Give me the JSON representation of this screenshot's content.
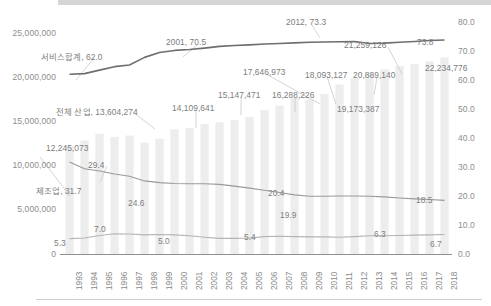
{
  "chart_data": {
    "type": "line",
    "title": "",
    "subtitle": "",
    "xlabel": "",
    "ylabel_left": "",
    "ylabel_right": "",
    "grid": false,
    "legend_position": "none",
    "categories": [
      "1993",
      "1994",
      "1995",
      "1996",
      "1997",
      "1998",
      "1999",
      "2000",
      "2001",
      "2002",
      "2003",
      "2004",
      "2005",
      "2006",
      "2007",
      "2008",
      "2009",
      "2010",
      "2011",
      "2012",
      "2013",
      "2014",
      "2015",
      "2016",
      "2017",
      "2018"
    ],
    "y_left_ticks": [
      "0",
      "5,000,000",
      "10,000,000",
      "15,000,000",
      "20,000,000",
      "25,000,000"
    ],
    "y_right_ticks": [
      "0.0",
      "10.0",
      "20.0",
      "30.0",
      "40.0",
      "50.0",
      "60.0",
      "70.0",
      "80.0"
    ],
    "ylim_left": [
      0,
      25000000
    ],
    "ylim_right": [
      0,
      80
    ],
    "series": [
      {
        "name": "전체 산업",
        "axis": "left",
        "type": "bar",
        "color": "#ededed",
        "values": [
          12245073,
          12846000,
          13604274,
          13250000,
          13400000,
          12600000,
          13050000,
          14109641,
          14250000,
          14700000,
          14900000,
          15147471,
          15500000,
          16288226,
          16800000,
          17646973,
          17500000,
          18093127,
          19173387,
          19900000,
          20400000,
          20889140,
          21259126,
          21500000,
          21800000,
          22234776
        ]
      },
      {
        "name": "서비스합계",
        "axis": "right",
        "type": "line",
        "color": "#6e6e6e",
        "values": [
          62.0,
          62.2,
          63.4,
          64.6,
          65.2,
          67.8,
          69.5,
          70.2,
          70.5,
          71.0,
          71.6,
          71.9,
          72.1,
          72.4,
          72.6,
          72.8,
          73.0,
          73.1,
          73.2,
          73.3,
          72.6,
          72.7,
          73.0,
          73.3,
          73.6,
          73.8
        ]
      },
      {
        "name": "제조업",
        "axis": "right",
        "type": "line",
        "color": "#9a9a9a",
        "values": [
          31.7,
          29.4,
          28.6,
          27.6,
          26.8,
          25.2,
          24.6,
          24.3,
          24.2,
          24.2,
          24.0,
          23.4,
          22.7,
          22.0,
          21.2,
          20.4,
          19.9,
          19.9,
          20.0,
          20.0,
          19.9,
          19.7,
          19.3,
          19.0,
          18.8,
          18.5
        ]
      },
      {
        "name": "건설업",
        "axis": "right",
        "type": "line",
        "color": "#b4b4b4",
        "values": [
          5.3,
          5.5,
          6.4,
          7.0,
          6.9,
          6.6,
          6.7,
          6.6,
          6.3,
          5.8,
          5.4,
          5.4,
          5.5,
          6.0,
          6.1,
          6.0,
          5.9,
          5.9,
          5.8,
          6.0,
          6.3,
          6.3,
          6.4,
          6.5,
          6.6,
          6.7
        ]
      }
    ],
    "annotations": [
      {
        "id": "a01",
        "text": "서비스합계, 62.0",
        "series": "서비스합계",
        "year": "1993",
        "value": 62.0
      },
      {
        "id": "a02",
        "text": "2001, 70.5",
        "series": "서비스합계",
        "year": "2001",
        "value": 70.5
      },
      {
        "id": "a03",
        "text": "2012, 73.3",
        "series": "서비스합계",
        "year": "2012",
        "value": 73.3
      },
      {
        "id": "a04",
        "text": "73.8",
        "series": "서비스합계",
        "year": "2018",
        "value": 73.8
      },
      {
        "id": "a05",
        "text": "제조업, 31.7",
        "series": "제조업",
        "year": "1993",
        "value": 31.7
      },
      {
        "id": "a06",
        "text": "29.4",
        "series": "제조업",
        "year": "1994",
        "value": 29.4
      },
      {
        "id": "a07",
        "text": "24.6",
        "series": "제조업",
        "year": "1999",
        "value": 24.6
      },
      {
        "id": "a08",
        "text": "20.4",
        "series": "제조업",
        "year": "2008",
        "value": 20.4
      },
      {
        "id": "a09",
        "text": "19.9",
        "series": "제조업",
        "year": "2009",
        "value": 19.9
      },
      {
        "id": "a10",
        "text": "18.5",
        "series": "제조업",
        "year": "2018",
        "value": 18.5
      },
      {
        "id": "a11",
        "text": "5.3",
        "series": "건설업",
        "year": "1993",
        "value": 5.3
      },
      {
        "id": "a12",
        "text": "7.0",
        "series": "건설업",
        "year": "1996",
        "value": 7.0
      },
      {
        "id": "a13",
        "text": "5.0",
        "series": "건설업",
        "year": "2001",
        "value": 5.0
      },
      {
        "id": "a14",
        "text": "5.4",
        "series": "건설업",
        "year": "2004",
        "value": 5.4
      },
      {
        "id": "a15",
        "text": "6.3",
        "series": "건설업",
        "year": "2014",
        "value": 6.3
      },
      {
        "id": "a16",
        "text": "6.7",
        "series": "건설업",
        "year": "2018",
        "value": 6.7
      },
      {
        "id": "a17",
        "text": "전체 산업, 13,604,274",
        "series": "전체 산업",
        "year": "1995",
        "value": 13604274
      },
      {
        "id": "a18",
        "text": "12,245,073",
        "series": "전체 산업",
        "year": "1993",
        "value": 12245073
      },
      {
        "id": "a19",
        "text": "14,109,641",
        "series": "전체 산업",
        "year": "2000",
        "value": 14109641
      },
      {
        "id": "a20",
        "text": "15,147,471",
        "series": "전체 산업",
        "year": "2004",
        "value": 15147471
      },
      {
        "id": "a21",
        "text": "16,288,226",
        "series": "전체 산업",
        "year": "2006",
        "value": 16288226
      },
      {
        "id": "a22",
        "text": "17,646,973",
        "series": "전체 산업",
        "year": "2008",
        "value": 17646973
      },
      {
        "id": "a23",
        "text": "18,093,127",
        "series": "전체 산업",
        "year": "2010",
        "value": 18093127
      },
      {
        "id": "a24",
        "text": "19,173,387",
        "series": "전체 산업",
        "year": "2011",
        "value": 19173387
      },
      {
        "id": "a25",
        "text": "20,889,140",
        "series": "전체 산업",
        "year": "2014",
        "value": 20889140
      },
      {
        "id": "a26",
        "text": "21,259,126",
        "series": "전체 산업",
        "year": "2015",
        "value": 21259126
      },
      {
        "id": "a27",
        "text": "22,234,776",
        "series": "전체 산업",
        "year": "2018",
        "value": 22234776
      }
    ]
  },
  "axes": {
    "left_ticks": [
      {
        "label": "25,000,000",
        "y": 33
      },
      {
        "label": "20,000,000",
        "y": 77
      },
      {
        "label": "15,000,000",
        "y": 121
      },
      {
        "label": "10,000,000",
        "y": 165
      },
      {
        "label": "5,000,000",
        "y": 209
      },
      {
        "label": "0",
        "y": 254
      }
    ],
    "right_ticks": [
      {
        "label": "80.0",
        "y": 22
      },
      {
        "label": "70.0",
        "y": 51
      },
      {
        "label": "60.0",
        "y": 80
      },
      {
        "label": "50.0",
        "y": 109
      },
      {
        "label": "40.0",
        "y": 138
      },
      {
        "label": "30.0",
        "y": 167
      },
      {
        "label": "20.0",
        "y": 196
      },
      {
        "label": "10.0",
        "y": 225
      },
      {
        "label": "0.0",
        "y": 254
      }
    ]
  },
  "annotation_positions": [
    {
      "id": "a01",
      "text": "서비스합계, 62.0",
      "x": 41,
      "y": 50
    },
    {
      "id": "a02",
      "text": "2001, 70.5",
      "x": 166,
      "y": 37
    },
    {
      "id": "a03",
      "text": "2012, 73.3",
      "x": 286,
      "y": 17
    },
    {
      "id": "a04",
      "text": "73.8",
      "x": 417,
      "y": 37
    },
    {
      "id": "a05",
      "text": "제조업, 31.7",
      "x": 36,
      "y": 184
    },
    {
      "id": "a06",
      "text": "29.4",
      "x": 88,
      "y": 160
    },
    {
      "id": "a07",
      "text": "24.6",
      "x": 128,
      "y": 198
    },
    {
      "id": "a08",
      "text": "20.4",
      "x": 268,
      "y": 188
    },
    {
      "id": "a09",
      "text": "19.9",
      "x": 280,
      "y": 210
    },
    {
      "id": "a10",
      "text": "18.5",
      "x": 416,
      "y": 195
    },
    {
      "id": "a11",
      "text": "5.3",
      "x": 54,
      "y": 238
    },
    {
      "id": "a12",
      "text": "7.0",
      "x": 94,
      "y": 224
    },
    {
      "id": "a13",
      "text": "5.0",
      "x": 158,
      "y": 236
    },
    {
      "id": "a14",
      "text": "5.4",
      "x": 244,
      "y": 232
    },
    {
      "id": "a15",
      "text": "6.3",
      "x": 374,
      "y": 229
    },
    {
      "id": "a16",
      "text": "6.7",
      "x": 430,
      "y": 239
    },
    {
      "id": "a17",
      "text": "전체 산업, 13,604,274",
      "x": 56,
      "y": 105
    },
    {
      "id": "a18",
      "text": "12,245,073",
      "x": 46,
      "y": 143
    },
    {
      "id": "a19",
      "text": "14,109,641",
      "x": 172,
      "y": 103
    },
    {
      "id": "a20",
      "text": "15,147,471",
      "x": 218,
      "y": 90
    },
    {
      "id": "a21",
      "text": "16,288,226",
      "x": 272,
      "y": 90
    },
    {
      "id": "a22",
      "text": "17,646,973",
      "x": 243,
      "y": 67
    },
    {
      "id": "a23",
      "text": "18,093,127",
      "x": 305,
      "y": 70
    },
    {
      "id": "a24",
      "text": "19,173,387",
      "x": 337,
      "y": 104
    },
    {
      "id": "a25",
      "text": "20,889,140",
      "x": 353,
      "y": 70
    },
    {
      "id": "a26",
      "text": "21,259,126",
      "x": 344,
      "y": 40
    },
    {
      "id": "a27",
      "text": "22,234,776",
      "x": 425,
      "y": 63
    }
  ],
  "leader_lines": [
    {
      "x1": 40,
      "y1": 157,
      "x2": 70,
      "y2": 196
    },
    {
      "x1": 107,
      "y1": 166,
      "x2": 100,
      "y2": 182
    },
    {
      "x1": 94,
      "y1": 58,
      "x2": 76,
      "y2": 80
    },
    {
      "x1": 197,
      "y1": 45,
      "x2": 183,
      "y2": 57
    },
    {
      "x1": 312,
      "y1": 25,
      "x2": 320,
      "y2": 38
    },
    {
      "x1": 133,
      "y1": 112,
      "x2": 155,
      "y2": 129
    },
    {
      "x1": 196,
      "y1": 110,
      "x2": 196,
      "y2": 128
    },
    {
      "x1": 241,
      "y1": 97,
      "x2": 241,
      "y2": 115
    },
    {
      "x1": 295,
      "y1": 97,
      "x2": 295,
      "y2": 112
    },
    {
      "x1": 266,
      "y1": 74,
      "x2": 320,
      "y2": 104
    },
    {
      "x1": 327,
      "y1": 77,
      "x2": 336,
      "y2": 104
    },
    {
      "x1": 377,
      "y1": 77,
      "x2": 374,
      "y2": 95
    },
    {
      "x1": 388,
      "y1": 47,
      "x2": 402,
      "y2": 74
    }
  ]
}
